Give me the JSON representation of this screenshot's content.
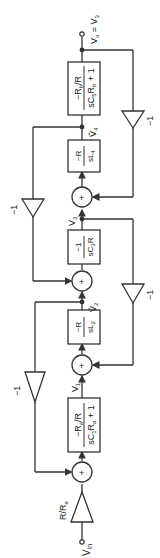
{
  "diagram": {
    "type": "signal-flow block diagram (ladder filter simulation)",
    "terminals": {
      "input": "V_in",
      "output": "V_o = V_3"
    },
    "input_gain": "R/R_a",
    "blocks": [
      {
        "id": "b1",
        "num": "−R_a/R",
        "den": "sC_1R_a + 1"
      },
      {
        "id": "b2",
        "num": "−R",
        "den": "sL_2"
      },
      {
        "id": "b3",
        "num": "−1",
        "den": "sC_3R"
      },
      {
        "id": "b4",
        "num": "−R",
        "den": "sL_4"
      },
      {
        "id": "b5",
        "num": "−R_b/R",
        "den": "sC_5R_b + 1"
      }
    ],
    "nodes": [
      "V_1",
      "V̂_2",
      "V_3",
      "V̂_4"
    ],
    "feedback_gains": [
      "−1",
      "−1",
      "−1",
      "−1"
    ],
    "summer_symbol": "+"
  }
}
